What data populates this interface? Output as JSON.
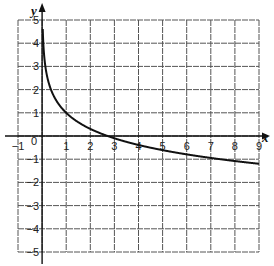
{
  "chart_data": {
    "type": "line",
    "title": "",
    "xlabel": "x",
    "ylabel": "y",
    "xlim": [
      -1,
      9
    ],
    "ylim": [
      -5,
      5
    ],
    "grid": true,
    "x_ticks": [
      "-1",
      "0",
      "1",
      "2",
      "3",
      "4",
      "5",
      "6",
      "7",
      "8",
      "9"
    ],
    "y_ticks": [
      "5",
      "4",
      "3",
      "2",
      "1",
      "-1",
      "-2",
      "-3",
      "-4",
      "-5"
    ],
    "series": [
      {
        "name": "y = 1 - ln(x)",
        "color": "#111111",
        "x": [
          0.02,
          0.05,
          0.1,
          0.2,
          0.3,
          0.5,
          0.75,
          1,
          1.5,
          2,
          2.5,
          3,
          4,
          5,
          6,
          7,
          8,
          9
        ],
        "values": [
          4.91,
          4.0,
          3.3,
          2.61,
          2.2,
          1.69,
          1.29,
          1.0,
          0.59,
          0.31,
          0.08,
          -0.1,
          -0.39,
          -0.61,
          -0.79,
          -0.95,
          -1.08,
          -1.2
        ]
      }
    ]
  },
  "colors": {
    "grid": "#555555",
    "axis": "#111111",
    "curve": "#111111"
  }
}
